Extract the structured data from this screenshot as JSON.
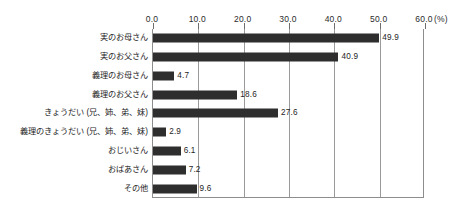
{
  "chart_data": {
    "type": "bar",
    "orientation": "horizontal",
    "title": "",
    "xlabel": "(%)",
    "ylabel": "",
    "xlim": [
      0.0,
      60.0
    ],
    "xticks": [
      "0.0",
      "10.0",
      "20.0",
      "30.0",
      "40.0",
      "50.0",
      "60.0"
    ],
    "xtick_values": [
      0,
      10,
      20,
      30,
      40,
      50,
      60
    ],
    "grid": true,
    "grid_axis": "x",
    "legend": false,
    "unit_label": "(%)",
    "bar_color": "#2e2e2e",
    "categories": [
      "実のお母さん",
      "実のお父さん",
      "義理のお母さん",
      "義理のお父さん",
      "きょうだい (兄、姉、弟、妹)",
      "義理のきょうだい (兄、姉、弟、妹)",
      "おじいさん",
      "おばあさん",
      "その他"
    ],
    "values": [
      49.9,
      40.9,
      4.7,
      18.6,
      27.6,
      2.9,
      6.1,
      7.2,
      9.6
    ],
    "value_labels": [
      "49.9",
      "40.9",
      "4.7",
      "18.6",
      "27.6",
      "2.9",
      "6.1",
      "7.2",
      "9.6"
    ]
  }
}
